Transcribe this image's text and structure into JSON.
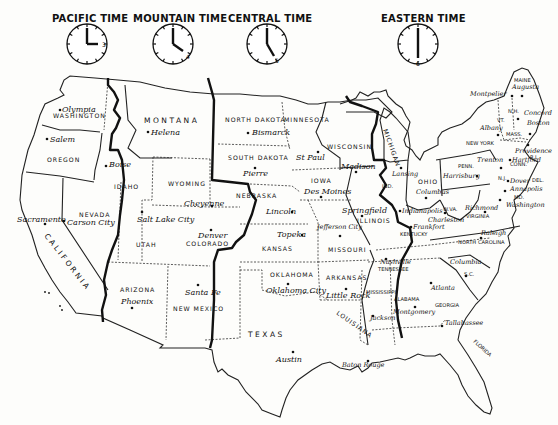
{
  "clocks": [
    {
      "zone": "PACIFIC TIME",
      "hour": 3,
      "minute": 0,
      "hour_label": "3"
    },
    {
      "zone": "MOUNTAIN TIME",
      "hour": 4,
      "minute": 0,
      "hour_label": "4"
    },
    {
      "zone": "CENTRAL TIME",
      "hour": 5,
      "minute": 0,
      "hour_label": "5"
    },
    {
      "zone": "EASTERN TIME",
      "hour": 6,
      "minute": 0,
      "hour_label": "6"
    }
  ],
  "states": {
    "washington": "WASHINGTON",
    "oregon": "OREGON",
    "california": "CALIFORNIA",
    "nevada": "NEVADA",
    "idaho": "IDAHO",
    "montana": "MONTANA",
    "wyoming": "WYOMING",
    "utah": "UTAH",
    "colorado": "COLORADO",
    "arizona": "ARIZONA",
    "new_mexico": "NEW MEXICO",
    "north_dakota": "NORTH DAKOTA",
    "south_dakota": "SOUTH DAKOTA",
    "nebraska": "NEBRASKA",
    "kansas": "KANSAS",
    "oklahoma": "OKLAHOMA",
    "texas": "TEXAS",
    "minnesota": "MINNESOTA",
    "iowa": "IOWA",
    "missouri": "MISSOURI",
    "arkansas": "ARKANSAS",
    "louisiana": "LOUISIANA",
    "wisconsin": "WISCONSIN",
    "illinois": "ILLINOIS",
    "michigan": "MICHIGAN",
    "indiana": "IND.",
    "ohio": "OHIO",
    "kentucky": "KENTUCKY",
    "tennessee": "TENNESSEE",
    "mississippi": "MISSISSIPPI",
    "alabama": "ALABAMA",
    "georgia": "GEORGIA",
    "florida": "FLORIDA",
    "south_carolina": "S.C.",
    "north_carolina": "NORTH CAROLINA",
    "virginia": "VIRGINIA",
    "west_virginia": "W.VA.",
    "pennsylvania": "PENN.",
    "new_york": "NEW YORK",
    "maine": "MAINE",
    "new_hampshire": "N.H.",
    "vermont": "VT.",
    "massachusetts": "MASS.",
    "rhode_island": "R.I.",
    "connecticut": "CONN.",
    "new_jersey": "N.J.",
    "delaware": "DEL.",
    "maryland": "MD."
  },
  "capitals": {
    "olympia": "Olympia",
    "salem": "Salem",
    "sacramento": "Sacramento",
    "carson_city": "Carson City",
    "boise": "Boise",
    "helena": "Helena",
    "cheyenne": "Cheyenne",
    "salt_lake_city": "Salt Lake City",
    "denver": "Denver",
    "phoenix": "Phoenix",
    "santa_fe": "Santa Fe",
    "bismarck": "Bismarck",
    "pierre": "Pierre",
    "lincoln": "Lincoln",
    "topeka": "Topeka",
    "oklahoma_city": "Oklahoma City",
    "austin": "Austin",
    "st_paul": "St Paul",
    "des_moines": "Des Moines",
    "jefferson_city": "Jefferson City",
    "little_rock": "Little Rock",
    "baton_rouge": "Baton Rouge",
    "madison": "Madison",
    "springfield": "Springfield",
    "lansing": "Lansing",
    "indianapolis": "Indianapolis",
    "columbus": "Columbus",
    "frankfort": "Frankfort",
    "nashville": "Nashville",
    "jackson": "Jackson",
    "montgomery": "Montgomery",
    "atlanta": "Atlanta",
    "tallahassee": "Tallahassee",
    "columbia": "Columbia",
    "raleigh": "Raleigh",
    "richmond": "Richmond",
    "charleston": "Charleston",
    "harrisburg": "Harrisburg",
    "albany": "Albany",
    "montpelier": "Montpelier",
    "augusta": "Augusta",
    "concord": "Concord",
    "boston": "Boston",
    "providence": "Providence",
    "hartford": "Hartford",
    "trenton": "Trenton",
    "dover": "Dover",
    "annapolis": "Annapolis",
    "washington": "Washington"
  },
  "colors": {
    "ink": "#111111",
    "paper": "#fdfdfb"
  }
}
